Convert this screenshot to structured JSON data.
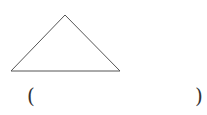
{
  "diagram": {
    "shape": "triangle",
    "vertices": [
      [
        65,
        15
      ],
      [
        11,
        71
      ],
      [
        120,
        71
      ]
    ],
    "stroke_color": "#555555"
  },
  "answer_blank": {
    "left_paren": "(",
    "right_paren": ")",
    "value": ""
  }
}
